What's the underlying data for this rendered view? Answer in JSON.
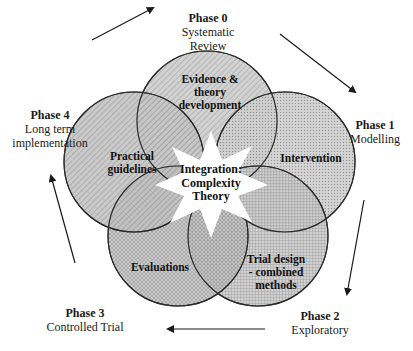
{
  "diagram": {
    "center": {
      "lines": [
        "Integration:",
        "Complexity",
        "Theory"
      ]
    },
    "circles": [
      {
        "id": "evidence",
        "lines": [
          "Evidence &",
          "theory",
          "development"
        ],
        "pattern": "diagonal-light"
      },
      {
        "id": "intervention",
        "lines": [
          "Intervention"
        ],
        "pattern": "dots"
      },
      {
        "id": "trial-design",
        "lines": [
          "Trial design",
          "- combined",
          "methods"
        ],
        "pattern": "grid-fine"
      },
      {
        "id": "evaluations",
        "lines": [
          "Evaluations"
        ],
        "pattern": "crosshatch"
      },
      {
        "id": "practical",
        "lines": [
          "Practical",
          "guidelines"
        ],
        "pattern": "diagonal-medium"
      }
    ],
    "phases": [
      {
        "title": "Phase 0",
        "name_lines": [
          "Systematic",
          "Review"
        ]
      },
      {
        "title": "Phase 1",
        "name_lines": [
          "Modelling"
        ]
      },
      {
        "title": "Phase 2",
        "name_lines": [
          "Exploratory"
        ]
      },
      {
        "title": "Phase 3",
        "name_lines": [
          "Controlled Trial"
        ]
      },
      {
        "title": "Phase 4",
        "name_lines": [
          "Long term",
          "implementation"
        ]
      }
    ],
    "arrows": [
      {
        "from": "Phase 4",
        "to": "Phase 0"
      },
      {
        "from": "Phase 0",
        "to": "Phase 1"
      },
      {
        "from": "Phase 1",
        "to": "Phase 2"
      },
      {
        "from": "Phase 2",
        "to": "Phase 3"
      },
      {
        "from": "Phase 3",
        "to": "Phase 4"
      }
    ],
    "colors": {
      "outline": "#2a2a2a",
      "fill_light": "#e6e6e6",
      "fill_mid": "#bdbdbd",
      "center_fill": "#ffffff"
    }
  }
}
